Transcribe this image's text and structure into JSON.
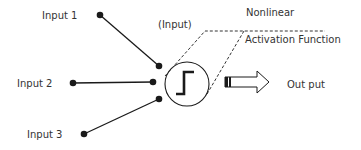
{
  "diagram": {
    "type": "perceptron-neuron",
    "inputs": [
      {
        "label": "Input 1"
      },
      {
        "label": "Input 2"
      },
      {
        "label": "Input 3"
      }
    ],
    "node_label": "(Input)",
    "activation": {
      "line1": "Nonlinear",
      "line2": "Activation Function",
      "icon": "step-function-icon"
    },
    "output_label": "Out put",
    "colors": {
      "stroke": "#1a1a1a",
      "text": "#333333",
      "background": "#ffffff"
    }
  }
}
